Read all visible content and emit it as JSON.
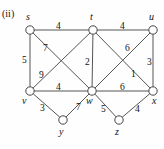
{
  "figure": {
    "caption": "(ii)",
    "width": 164,
    "height": 149,
    "stroke_color": "#555555",
    "node_fill": "#ffffff",
    "node_stroke": "#444444",
    "node_radius": 4.2
  },
  "chart_data": {
    "type": "diagram",
    "subtype": "weighted-undirected-graph",
    "title": "(ii)",
    "nodes": [
      {
        "id": "s",
        "label": "s",
        "x": 30,
        "y": 30,
        "label_x": 26,
        "label_y": 12
      },
      {
        "id": "t",
        "label": "t",
        "x": 93,
        "y": 30,
        "label_x": 90,
        "label_y": 12
      },
      {
        "id": "u",
        "label": "u",
        "x": 153,
        "y": 30,
        "label_x": 149,
        "label_y": 12
      },
      {
        "id": "v",
        "label": "v",
        "x": 30,
        "y": 91,
        "label_x": 22,
        "label_y": 96
      },
      {
        "id": "w",
        "label": "w",
        "x": 92,
        "y": 91,
        "label_x": 86,
        "label_y": 96
      },
      {
        "id": "x",
        "label": "x",
        "x": 153,
        "y": 91,
        "label_x": 152,
        "label_y": 96
      },
      {
        "id": "y",
        "label": "y",
        "x": 63,
        "y": 120,
        "label_x": 59,
        "label_y": 127
      },
      {
        "id": "z",
        "label": "z",
        "x": 119,
        "y": 120,
        "label_x": 115,
        "label_y": 127
      }
    ],
    "edges": [
      {
        "source": "s",
        "target": "t",
        "weight": 4,
        "label_x": 56,
        "label_y": 22
      },
      {
        "source": "t",
        "target": "u",
        "weight": 4,
        "label_x": 120,
        "label_y": 22
      },
      {
        "source": "s",
        "target": "v",
        "weight": 5,
        "label_x": 22,
        "label_y": 56
      },
      {
        "source": "s",
        "target": "w",
        "weight": 7,
        "label_x": 43,
        "label_y": 44
      },
      {
        "source": "v",
        "target": "t",
        "weight": 9,
        "label_x": 39,
        "label_y": 71
      },
      {
        "source": "t",
        "target": "w",
        "weight": 2,
        "label_x": 85,
        "label_y": 58
      },
      {
        "source": "t",
        "target": "x",
        "weight": 1,
        "label_x": 131,
        "label_y": 70
      },
      {
        "source": "u",
        "target": "w",
        "weight": 6,
        "label_x": 125,
        "label_y": 44
      },
      {
        "source": "u",
        "target": "x",
        "weight": 3,
        "label_x": 147,
        "label_y": 58
      },
      {
        "source": "v",
        "target": "w",
        "weight": 4,
        "label_x": 56,
        "label_y": 83
      },
      {
        "source": "w",
        "target": "x",
        "weight": 6,
        "label_x": 120,
        "label_y": 83
      },
      {
        "source": "v",
        "target": "y",
        "weight": 3,
        "label_x": 40,
        "label_y": 104
      },
      {
        "source": "y",
        "target": "w",
        "weight": 7,
        "label_x": 76,
        "label_y": 103
      },
      {
        "source": "w",
        "target": "z",
        "weight": 5,
        "label_x": 101,
        "label_y": 105
      },
      {
        "source": "z",
        "target": "x",
        "weight": 4,
        "label_x": 135,
        "label_y": 105
      }
    ],
    "xlabel": "",
    "ylabel": "",
    "grid": false,
    "legend": null
  }
}
